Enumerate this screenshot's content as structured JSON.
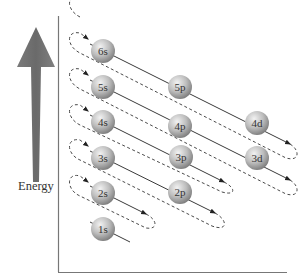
{
  "diagram": {
    "axis_label": "Energy",
    "colors": {
      "arrow": "#6e6e6e",
      "axis": "#6a6a6a",
      "line": "#3a3a3a",
      "dashed": "#4a4a4a",
      "sphere_light": "#e6e6e6",
      "sphere_dark": "#8a8a8a"
    },
    "orbitals": [
      {
        "n": "1",
        "l": "s",
        "label": "1s",
        "x": 103,
        "y": 229
      },
      {
        "n": "2",
        "l": "s",
        "label": "2s",
        "x": 103,
        "y": 193
      },
      {
        "n": "2",
        "l": "p",
        "label": "2p",
        "x": 180,
        "y": 192
      },
      {
        "n": "3",
        "l": "s",
        "label": "3s",
        "x": 103,
        "y": 158
      },
      {
        "n": "3",
        "l": "p",
        "label": "3p",
        "x": 181,
        "y": 157
      },
      {
        "n": "3",
        "l": "d",
        "label": "3d",
        "x": 257,
        "y": 158
      },
      {
        "n": "4",
        "l": "s",
        "label": "4s",
        "x": 103,
        "y": 122
      },
      {
        "n": "4",
        "l": "p",
        "label": "4p",
        "x": 180,
        "y": 126
      },
      {
        "n": "4",
        "l": "d",
        "label": "4d",
        "x": 257,
        "y": 123
      },
      {
        "n": "5",
        "l": "s",
        "label": "5s",
        "x": 103,
        "y": 87
      },
      {
        "n": "5",
        "l": "p",
        "label": "5p",
        "x": 180,
        "y": 87
      },
      {
        "n": "6",
        "l": "s",
        "label": "6s",
        "x": 103,
        "y": 51
      }
    ],
    "filling_order": [
      "1s",
      "2s",
      "2p",
      "3s",
      "3p",
      "4s",
      "3d",
      "4p",
      "5s",
      "4d",
      "5p",
      "6s"
    ]
  }
}
